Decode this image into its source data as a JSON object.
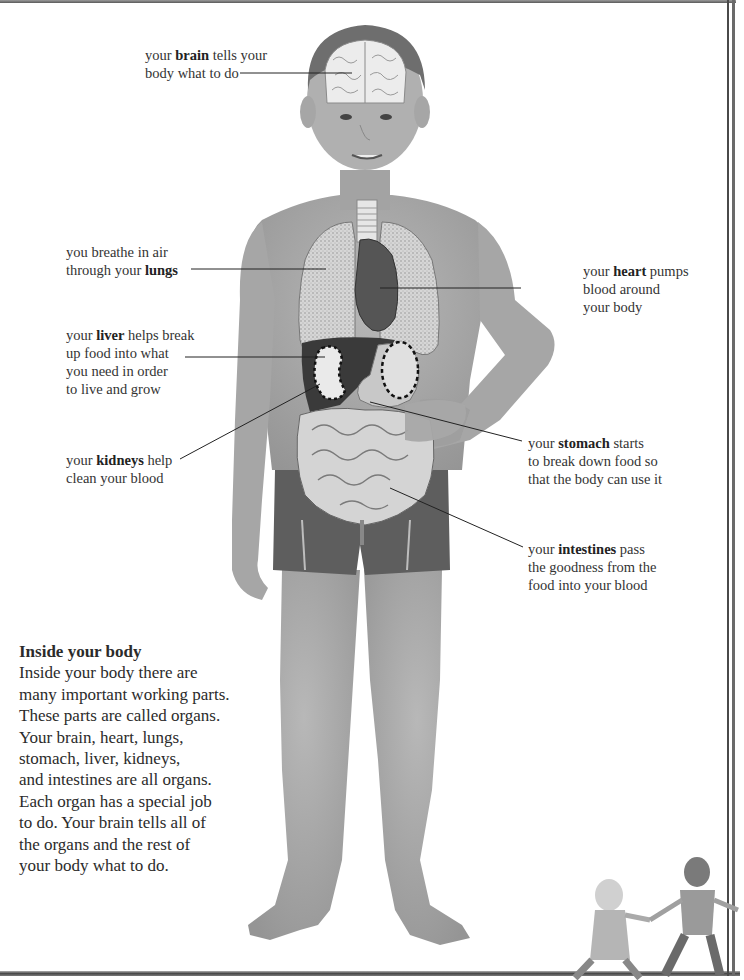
{
  "page": {
    "title": "Inside your body"
  },
  "labels": {
    "brain": {
      "pre": "your ",
      "keyword": "brain",
      "post": " tells your",
      "line2": "body what to do"
    },
    "lungs": {
      "line1": "you breathe in air",
      "pre": "through your ",
      "keyword": "lungs"
    },
    "heart": {
      "pre": "your ",
      "keyword": "heart",
      "post": " pumps",
      "line2": "blood around",
      "line3": "your body"
    },
    "liver": {
      "pre": "your ",
      "keyword": "liver",
      "post": " helps break",
      "line2": "up food into what",
      "line3": "you need in order",
      "line4": "to live and grow"
    },
    "kidneys": {
      "pre": "your ",
      "keyword": "kidneys",
      "post": " help",
      "line2": "clean your blood"
    },
    "stomach": {
      "pre": "your ",
      "keyword": "stomach",
      "post": " starts",
      "line2": "to break down food so",
      "line3": "that the body can use it"
    },
    "intestines": {
      "pre": "your ",
      "keyword": "intestines",
      "post": " pass",
      "line2": "the goodness from the",
      "line3": "food into your blood"
    }
  },
  "article": {
    "heading": "Inside your body",
    "lines": [
      "Inside your body there are",
      "many important working parts.",
      "These parts are called organs.",
      "Your brain, heart, lungs,",
      "stomach, liver, kidneys,",
      "and intestines are all organs.",
      "Each organ has a special job",
      "to do. Your brain tells all of",
      "the organs and the rest of",
      "your body what to do."
    ]
  },
  "colors": {
    "skin": "#a9a9a9",
    "shorts": "#5e5e5e",
    "organ_light": "#e4e4e4",
    "organ_dark": "#3a3a3a",
    "text": "#2b2b2b"
  }
}
